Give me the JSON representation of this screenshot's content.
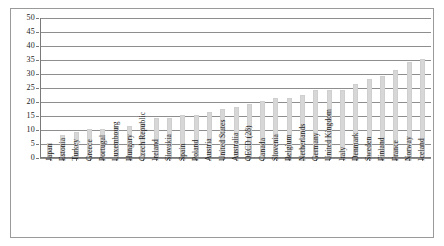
{
  "chart_data": {
    "type": "bar",
    "title": "",
    "subtitle": "",
    "xlabel": "",
    "ylabel": "",
    "ylim": [
      0,
      50
    ],
    "yticks": [
      0,
      5,
      10,
      15,
      20,
      25,
      30,
      35,
      40,
      45,
      50
    ],
    "grid": true,
    "legend": null,
    "bar_color": "#d7d7d7",
    "axis_color": "#7a7a7a",
    "categories": [
      "Japan",
      "Estonia",
      "Turkey",
      "Greece",
      "Portugal",
      "Luxembourg",
      "Hungary",
      "Czech Republic",
      "Ireland",
      "Slovakia",
      "Spain",
      "Poland",
      "Austria",
      "United States",
      "Australia",
      "OECD (28)",
      "Canada",
      "Slovenia",
      "Belgium",
      "Netherlands",
      "Germany",
      "United Kingdom",
      "Italy",
      "Denmark",
      "Sweden",
      "Finland",
      "France",
      "Norway",
      "Iceland"
    ],
    "values": [
      5,
      8,
      9,
      10,
      10,
      11,
      11,
      12,
      14,
      14,
      15,
      15,
      16,
      17,
      18,
      19,
      20,
      21,
      21,
      22,
      24,
      24,
      24,
      26,
      28,
      29,
      31,
      34,
      35
    ]
  }
}
